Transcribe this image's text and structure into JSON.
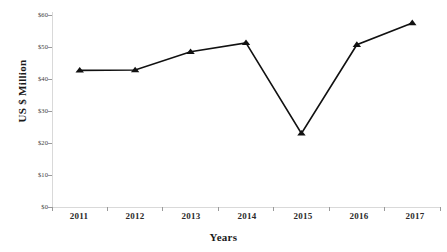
{
  "chart_data": {
    "type": "line",
    "title": "",
    "xlabel": "Years",
    "ylabel": "US $  Million",
    "categories": [
      "2011",
      "2012",
      "2013",
      "2014",
      "2015",
      "2016",
      "2017"
    ],
    "values": [
      42.7,
      42.8,
      48.5,
      51.3,
      23.0,
      50.7,
      57.5
    ],
    "series": [
      {
        "name": "",
        "values": [
          42.7,
          42.8,
          48.5,
          51.3,
          23.0,
          50.7,
          57.5
        ]
      }
    ],
    "ylim": [
      0,
      60
    ],
    "ytick_labels": [
      "$60",
      "$50",
      "$40",
      "$30",
      "$20",
      "$10",
      "$0"
    ],
    "ytick_values": [
      60,
      50,
      40,
      30,
      20,
      10,
      0
    ],
    "xtick_labels": [
      "2011",
      "2012",
      "2013",
      "2014",
      "2015",
      "2016",
      "2017"
    ],
    "grid": false,
    "legend": "none",
    "marker": "triangle",
    "line_color": "#111111",
    "axis_color": "#d9d9d9",
    "tick_color": "#9a9a9a",
    "text_color": "#1a1a1a"
  },
  "axes": {
    "y_title": "US $  Million",
    "x_title": "Years"
  }
}
